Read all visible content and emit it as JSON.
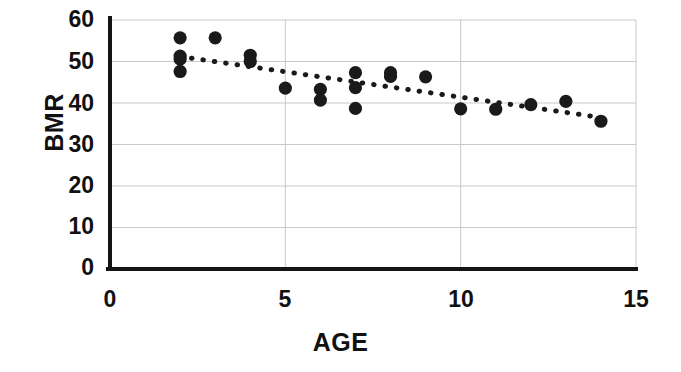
{
  "chart_data": {
    "type": "scatter",
    "title": "",
    "xlabel": "AGE",
    "ylabel": "BMR",
    "xlim": [
      0,
      15
    ],
    "ylim": [
      0,
      60
    ],
    "xticks": [
      0,
      5,
      10,
      15
    ],
    "yticks": [
      0,
      10,
      20,
      30,
      40,
      50,
      60
    ],
    "grid": true,
    "grid_axis": "y",
    "legend": null,
    "marker": "filled-circle",
    "marker_color": "#1a1a1a",
    "points": [
      {
        "x": 2,
        "y": 55.7
      },
      {
        "x": 2,
        "y": 51.3
      },
      {
        "x": 2,
        "y": 50.6
      },
      {
        "x": 2,
        "y": 47.6
      },
      {
        "x": 3,
        "y": 55.7
      },
      {
        "x": 4,
        "y": 51.5
      },
      {
        "x": 4,
        "y": 50.0
      },
      {
        "x": 5,
        "y": 43.6
      },
      {
        "x": 6,
        "y": 43.3
      },
      {
        "x": 6,
        "y": 40.7
      },
      {
        "x": 7,
        "y": 47.3
      },
      {
        "x": 7,
        "y": 43.7
      },
      {
        "x": 7,
        "y": 38.7
      },
      {
        "x": 8,
        "y": 47.3
      },
      {
        "x": 8,
        "y": 46.4
      },
      {
        "x": 9,
        "y": 46.3
      },
      {
        "x": 10,
        "y": 38.6
      },
      {
        "x": 11,
        "y": 38.5
      },
      {
        "x": 12,
        "y": 39.6
      },
      {
        "x": 13,
        "y": 40.4
      },
      {
        "x": 14,
        "y": 35.6
      }
    ],
    "trendline": {
      "style": "dotted",
      "color": "#1a1a1a",
      "x_start": 2,
      "y_start": 51.2,
      "x_end": 14,
      "y_end": 36.5
    }
  },
  "axis": {
    "y_tick_labels": [
      "60",
      "50",
      "40",
      "30",
      "20",
      "10",
      "0"
    ],
    "x_tick_labels": [
      "0",
      "5",
      "10",
      "15"
    ],
    "y_title": "BMR",
    "x_title": "AGE"
  },
  "colors": {
    "marker": "#1a1a1a",
    "axis": "#141414",
    "grid": "#c9c9c9",
    "background": "#ffffff"
  }
}
